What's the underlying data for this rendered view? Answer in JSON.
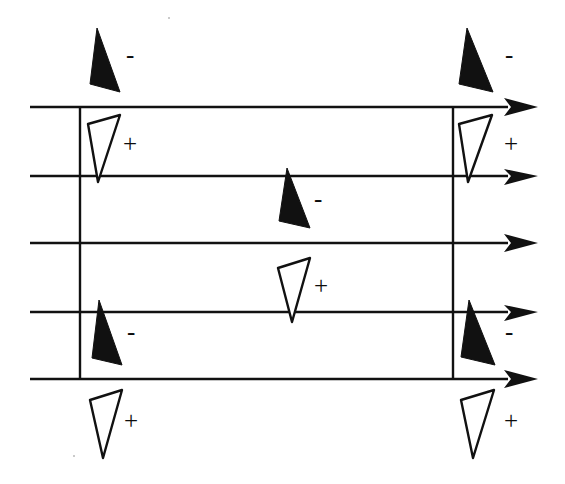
{
  "figure": {
    "background_color": "#ffffff",
    "ink_color": "#111111",
    "width": 565,
    "height": 484
  },
  "axes": {
    "description": "Five horizontal arrow lines pointing right",
    "x_start": 30,
    "x_end": 538,
    "arrowhead_length": 30,
    "stroke_width": 2.6,
    "lines": [
      {
        "id": "axis-1",
        "y": 107,
        "label": ""
      },
      {
        "id": "axis-2",
        "y": 176,
        "label": ""
      },
      {
        "id": "axis-3",
        "y": 243,
        "label": ""
      },
      {
        "id": "axis-4",
        "y": 312,
        "label": ""
      },
      {
        "id": "axis-5",
        "y": 379,
        "label": ""
      }
    ]
  },
  "verticals": [
    {
      "id": "vertical-left",
      "x": 80,
      "y_top": 106,
      "y_bottom": 380
    },
    {
      "id": "vertical-right",
      "x": 453,
      "y_top": 106,
      "y_bottom": 380
    }
  ],
  "markers": [
    {
      "id": "marker-1",
      "polarity": "-",
      "fill": "filled",
      "column": "left",
      "x": 90,
      "y": 28,
      "sign_x": 126,
      "sign_y": 42
    },
    {
      "id": "marker-2",
      "polarity": "-",
      "fill": "filled",
      "column": "right",
      "x": 459,
      "y": 28,
      "sign_x": 505,
      "sign_y": 42
    },
    {
      "id": "marker-3",
      "polarity": "+",
      "fill": "outline",
      "column": "left",
      "x": 88,
      "y": 115,
      "sign_x": 123,
      "sign_y": 131
    },
    {
      "id": "marker-4",
      "polarity": "+",
      "fill": "outline",
      "column": "right",
      "x": 459,
      "y": 115,
      "sign_x": 504,
      "sign_y": 131
    },
    {
      "id": "marker-5",
      "polarity": "-",
      "fill": "filled",
      "column": "center",
      "x": 279,
      "y": 168,
      "sign_x": 314,
      "sign_y": 186
    },
    {
      "id": "marker-6",
      "polarity": "+",
      "fill": "outline",
      "column": "center",
      "x": 278,
      "y": 258,
      "sign_x": 314,
      "sign_y": 273
    },
    {
      "id": "marker-7",
      "polarity": "-",
      "fill": "filled",
      "column": "left",
      "x": 92,
      "y": 300,
      "sign_x": 127,
      "sign_y": 319
    },
    {
      "id": "marker-8",
      "polarity": "-",
      "fill": "filled",
      "column": "right",
      "x": 461,
      "y": 300,
      "sign_x": 505,
      "sign_y": 319
    },
    {
      "id": "marker-9",
      "polarity": "+",
      "fill": "outline",
      "column": "left",
      "x": 90,
      "y": 390,
      "sign_x": 124,
      "sign_y": 408
    },
    {
      "id": "marker-10",
      "polarity": "+",
      "fill": "outline",
      "column": "right",
      "x": 461,
      "y": 390,
      "sign_x": 504,
      "sign_y": 408
    }
  ],
  "signs": {
    "plus": "+",
    "minus": "−"
  },
  "specks": [
    {
      "x": 168,
      "y": 17
    },
    {
      "x": 73,
      "y": 455
    }
  ]
}
